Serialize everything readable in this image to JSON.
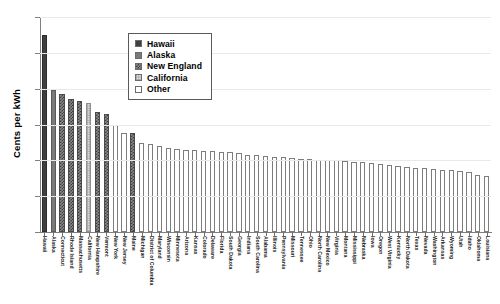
{
  "chart_data": {
    "type": "bar",
    "title": "",
    "xlabel": "",
    "ylabel": "Cents per kWh",
    "ylim": [
      0,
      30
    ],
    "yticks": [
      0,
      5,
      10,
      15,
      20,
      25,
      30
    ],
    "grid": true,
    "legend_position": "top-center",
    "legend": [
      {
        "label": "Hawaii",
        "pattern": "solid-dark",
        "color": "#404040"
      },
      {
        "label": "Alaska",
        "pattern": "solid-gray",
        "color": "#7a7a7a"
      },
      {
        "label": "New England",
        "pattern": "crosshatch",
        "color": "#8a8a8a"
      },
      {
        "label": "California",
        "pattern": "fine-grid",
        "color": "#dcdcdc"
      },
      {
        "label": "Other",
        "pattern": "open",
        "color": "#ffffff"
      }
    ],
    "categories": [
      "Hawaii",
      "Alaska",
      "Connecticut",
      "Rhode Island",
      "Massachusetts",
      "California",
      "New Hampshire",
      "Vermont",
      "New York",
      "New Jersey",
      "Maine",
      "Michigan",
      "District of Columbia",
      "Maryland",
      "Wisconsin",
      "Minnesota",
      "Arizona",
      "Kansas",
      "Colorado",
      "Delaware",
      "Florida",
      "South Dakota",
      "Georgia",
      "Indiana",
      "South Carolina",
      "Alabama",
      "Illinois",
      "Pennsylvania",
      "Missouri",
      "Tennessee",
      "Ohio",
      "North Carolina",
      "New Mexico",
      "Virginia",
      "Montana",
      "Mississippi",
      "Nebraska",
      "Iowa",
      "Oregon",
      "West Virginia",
      "Kentucky",
      "North Dakota",
      "Texas",
      "Nevada",
      "Washington",
      "Arkansas",
      "Wyoming",
      "Utah",
      "Idaho",
      "Oklahoma",
      "Louisiana"
    ],
    "values": [
      27.5,
      19.8,
      19.2,
      18.6,
      18.3,
      18.0,
      16.8,
      16.4,
      15.0,
      13.8,
      13.8,
      12.4,
      12.3,
      12.0,
      11.7,
      11.6,
      11.5,
      11.4,
      11.3,
      11.3,
      11.2,
      11.1,
      11.0,
      10.8,
      10.7,
      10.6,
      10.5,
      10.5,
      10.3,
      10.2,
      10.2,
      10.1,
      10.0,
      10.0,
      9.9,
      9.8,
      9.7,
      9.6,
      9.5,
      9.4,
      9.2,
      9.1,
      9.0,
      8.9,
      8.8,
      8.7,
      8.6,
      8.5,
      8.4,
      7.9,
      7.8
    ],
    "series_group": [
      "hawaii",
      "alaska",
      "newengland",
      "newengland",
      "newengland",
      "california",
      "newengland",
      "newengland",
      "other",
      "other",
      "newengland",
      "other",
      "other",
      "other",
      "other",
      "other",
      "other",
      "other",
      "other",
      "other",
      "other",
      "other",
      "other",
      "other",
      "other",
      "other",
      "other",
      "other",
      "other",
      "other",
      "other",
      "other",
      "other",
      "other",
      "other",
      "other",
      "other",
      "other",
      "other",
      "other",
      "other",
      "other",
      "other",
      "other",
      "other",
      "other",
      "other",
      "other",
      "other",
      "other",
      "other"
    ]
  }
}
